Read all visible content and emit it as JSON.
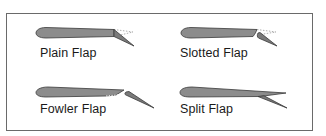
{
  "diagram": {
    "type": "airfoil-flap-types",
    "colors": {
      "frame": "#6a6a6a",
      "airfoil_fill": "#8c8c8c",
      "airfoil_stroke": "#3a3a3a",
      "flap_fill": "#7a7a7a",
      "dotted_line": "#9a9a9a",
      "label": "#1a1a1a"
    },
    "panels": [
      {
        "id": "plain",
        "label": "Plain Flap",
        "position": "top-left"
      },
      {
        "id": "slotted",
        "label": "Slotted Flap",
        "position": "top-right"
      },
      {
        "id": "fowler",
        "label": "Fowler Flap",
        "position": "bottom-left"
      },
      {
        "id": "split",
        "label": "Split Flap",
        "position": "bottom-right"
      }
    ]
  }
}
